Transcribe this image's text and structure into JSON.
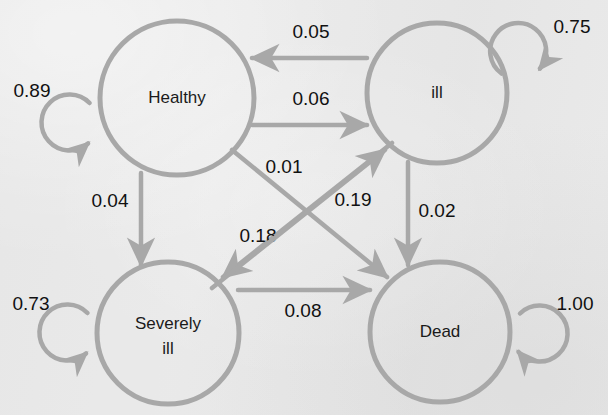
{
  "figure": {
    "type": "state-transition-diagram",
    "background_color": "#e9e9e9",
    "stroke_color": "#a8a8a8",
    "text_color": "#1a1a1a",
    "width": 608,
    "height": 415
  },
  "nodes": [
    {
      "id": "healthy",
      "label": "Healthy",
      "label_line1": "Healthy",
      "label_line2": "",
      "cx": 177,
      "cy": 98,
      "r": 77
    },
    {
      "id": "ill",
      "label": "ill",
      "label_line1": "ill",
      "label_line2": "",
      "cx": 437,
      "cy": 93,
      "r": 70
    },
    {
      "id": "severely_ill",
      "label": "Severely ill",
      "label_line1": "Severely",
      "label_line2": "ill",
      "cx": 168,
      "cy": 333,
      "r": 71
    },
    {
      "id": "dead",
      "label": "Dead",
      "label_line1": "Dead",
      "label_line2": "",
      "cx": 440,
      "cy": 332,
      "r": 70
    }
  ],
  "self_loops": [
    {
      "id": "healthy-self",
      "from": "healthy",
      "to": "healthy",
      "probability": "0.89",
      "cx": 67,
      "cy": 122,
      "r": 28,
      "label_x": 32,
      "label_y": 92
    },
    {
      "id": "ill-self",
      "from": "ill",
      "to": "ill",
      "probability": "0.75",
      "cx": 521,
      "cy": 54,
      "r": 28,
      "label_x": 572,
      "label_y": 28
    },
    {
      "id": "severely-ill-self",
      "from": "severely_ill",
      "to": "severely_ill",
      "probability": "0.73",
      "cx": 65,
      "cy": 332,
      "r": 28,
      "label_x": 31,
      "label_y": 305
    },
    {
      "id": "dead-self",
      "from": "dead",
      "to": "dead",
      "probability": "1.00",
      "cx": 540,
      "cy": 332,
      "r": 28,
      "label_x": 575,
      "label_y": 305
    }
  ],
  "edges": [
    {
      "id": "ill-to-healthy",
      "from": "ill",
      "to": "healthy",
      "probability": "0.05",
      "x1": 367,
      "y1": 58,
      "x2": 252,
      "y2": 58,
      "label_x": 311,
      "label_y": 33
    },
    {
      "id": "healthy-to-ill",
      "from": "healthy",
      "to": "ill",
      "probability": "0.06",
      "x1": 252,
      "y1": 125,
      "x2": 367,
      "y2": 125,
      "label_x": 311,
      "label_y": 100
    },
    {
      "id": "healthy-to-severely-ill",
      "from": "healthy",
      "to": "severely_ill",
      "probability": "0.04",
      "x1": 141,
      "y1": 173,
      "x2": 141,
      "y2": 265,
      "label_x": 110,
      "label_y": 202
    },
    {
      "id": "ill-to-dead",
      "from": "ill",
      "to": "dead",
      "probability": "0.02",
      "x1": 408,
      "y1": 162,
      "x2": 408,
      "y2": 265,
      "label_x": 437,
      "label_y": 212
    },
    {
      "id": "severely-ill-to-dead",
      "from": "severely_ill",
      "to": "dead",
      "probability": "0.08",
      "x1": 238,
      "y1": 290,
      "x2": 370,
      "y2": 290,
      "label_x": 303,
      "label_y": 312
    },
    {
      "id": "healthy-to-dead",
      "from": "healthy",
      "to": "dead",
      "probability": "0.01",
      "x1": 232,
      "y1": 150,
      "x2": 387,
      "y2": 277,
      "label_x": 284,
      "label_y": 168
    },
    {
      "id": "ill-to-severely-ill",
      "from": "ill",
      "to": "severely_ill",
      "probability": "0.18",
      "x1": 392,
      "y1": 143,
      "x2": 223,
      "y2": 277,
      "label_x": 258,
      "label_y": 237
    },
    {
      "id": "severely-ill-to-ill",
      "from": "severely_ill",
      "to": "ill",
      "probability": "0.19",
      "x1": 212,
      "y1": 288,
      "x2": 385,
      "y2": 150,
      "label_x": 353,
      "label_y": 201
    }
  ]
}
